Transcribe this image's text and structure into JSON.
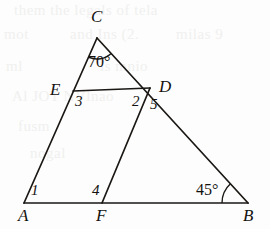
{
  "figure": {
    "kind": "geometry-diagram",
    "width": 270,
    "height": 229,
    "stroke_color": "#1a1714",
    "background_color": "#fdfdfd",
    "bleed_color": "#f0f0ef"
  },
  "points": {
    "A": {
      "label": "A",
      "x": 24,
      "y": 203,
      "label_x": 18,
      "label_y": 207
    },
    "B": {
      "label": "B",
      "x": 248,
      "y": 203,
      "label_x": 243,
      "label_y": 207
    },
    "C": {
      "label": "C",
      "x": 97,
      "y": 38,
      "label_x": 91,
      "label_y": 8
    },
    "D": {
      "label": "D",
      "x": 150,
      "y": 88,
      "label_x": 159,
      "label_y": 78
    },
    "E": {
      "label": "E",
      "x": 73,
      "y": 91,
      "label_x": 50,
      "label_y": 81
    },
    "F": {
      "label": "F",
      "x": 102,
      "y": 203,
      "label_x": 96,
      "label_y": 207
    }
  },
  "segments": [
    {
      "name": "side-AB",
      "from": "A",
      "to": "B"
    },
    {
      "name": "side-AC",
      "from": "A",
      "to": "C"
    },
    {
      "name": "side-CB",
      "from": "C",
      "to": "B"
    },
    {
      "name": "segment-ED",
      "from": "E",
      "to": "D"
    },
    {
      "name": "segment-FD",
      "from": "F",
      "to": "D"
    }
  ],
  "angle_labels": [
    {
      "name": "angle-C",
      "text": "70°",
      "x": 88,
      "y": 54,
      "type": "measure"
    },
    {
      "name": "angle-B",
      "text": "45°",
      "x": 196,
      "y": 182,
      "type": "measure"
    },
    {
      "name": "angle-1",
      "text": "1",
      "x": 31,
      "y": 183,
      "type": "number"
    },
    {
      "name": "angle-3",
      "text": "3",
      "x": 75,
      "y": 94,
      "type": "number"
    },
    {
      "name": "angle-2",
      "text": "2",
      "x": 132,
      "y": 94,
      "type": "number"
    },
    {
      "name": "angle-5",
      "text": "5",
      "x": 150,
      "y": 97,
      "type": "number"
    },
    {
      "name": "angle-4",
      "text": "4",
      "x": 92,
      "y": 183,
      "type": "number"
    }
  ],
  "arcs": [
    {
      "name": "arc-angle-C",
      "at": "C",
      "radius": 21
    },
    {
      "name": "arc-angle-B",
      "at": "B",
      "radius": 26
    }
  ],
  "bleed_text": [
    {
      "text": "them the  legals  of tela",
      "x": 14,
      "y": 2
    },
    {
      "text": "mot",
      "x": 4,
      "y": 26
    },
    {
      "text": "and  Ins (2.",
      "x": 70,
      "y": 26
    },
    {
      "text": "milas  9",
      "x": 176,
      "y": 26
    },
    {
      "text": "ml",
      "x": 6,
      "y": 58
    },
    {
      "text": "is  mnio",
      "x": 100,
      "y": 58
    },
    {
      "text": "Al  JOT  NVlnao",
      "x": 12,
      "y": 88
    },
    {
      "text": "fusm",
      "x": 18,
      "y": 118
    },
    {
      "text": "nogal",
      "x": 30,
      "y": 145
    }
  ]
}
